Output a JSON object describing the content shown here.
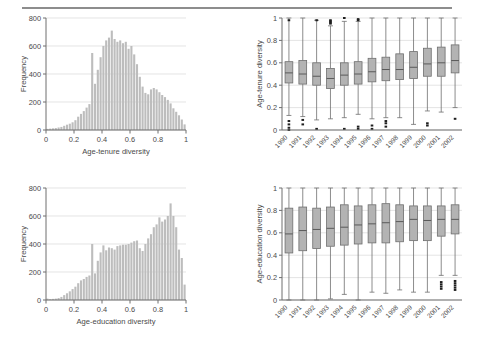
{
  "figure": {
    "caption_clipped": "",
    "panels": [
      "age-tenure-histogram",
      "age-tenure-boxplot",
      "age-education-histogram",
      "age-education-boxplot"
    ]
  },
  "colors": {
    "bar_fill": "#bdbdbd",
    "box_fill": "#b3b3b3",
    "line": "#6e6e6e",
    "grid": "#d8d8d8",
    "text": "#4a4a4a",
    "rule": "#8d8d8d"
  },
  "chart_data": [
    {
      "id": "age-tenure-histogram",
      "type": "bar",
      "title": "",
      "xlabel": "Age-tenure diversity",
      "ylabel": "Frequency",
      "xlim": [
        0,
        1
      ],
      "ylim": [
        0,
        800
      ],
      "xticks": [
        "0",
        "0.2",
        "0.4",
        "0.6",
        "0.8",
        "1"
      ],
      "xtick_values": [
        0,
        0.2,
        0.4,
        0.6,
        0.8,
        1
      ],
      "yticks": [
        "0",
        "200",
        "400",
        "600",
        "800"
      ],
      "ytick_values": [
        0,
        200,
        400,
        600,
        800
      ],
      "grid": "horizontal",
      "bin_width": 0.02,
      "categories": [
        0.01,
        0.03,
        0.05,
        0.07,
        0.09,
        0.11,
        0.13,
        0.15,
        0.17,
        0.19,
        0.21,
        0.23,
        0.25,
        0.27,
        0.29,
        0.31,
        0.33,
        0.35,
        0.37,
        0.39,
        0.41,
        0.43,
        0.45,
        0.47,
        0.49,
        0.51,
        0.53,
        0.55,
        0.57,
        0.59,
        0.61,
        0.63,
        0.65,
        0.67,
        0.69,
        0.71,
        0.73,
        0.75,
        0.77,
        0.79,
        0.81,
        0.83,
        0.85,
        0.87,
        0.89,
        0.91,
        0.93,
        0.95,
        0.97,
        0.99
      ],
      "values": [
        8,
        10,
        12,
        14,
        18,
        22,
        30,
        38,
        45,
        55,
        70,
        95,
        115,
        135,
        160,
        185,
        550,
        330,
        430,
        520,
        600,
        640,
        660,
        710,
        650,
        630,
        640,
        620,
        630,
        580,
        600,
        540,
        470,
        380,
        310,
        265,
        255,
        290,
        300,
        290,
        270,
        250,
        235,
        215,
        190,
        155,
        130,
        105,
        75,
        40
      ]
    },
    {
      "id": "age-tenure-boxplot",
      "type": "box",
      "title": "",
      "xlabel": "",
      "ylabel": "Age-tenure diversity",
      "ylim": [
        0,
        1
      ],
      "yticks": [
        "0",
        "0.2",
        "0.4",
        "0.6",
        "0.8",
        "1"
      ],
      "ytick_values": [
        0,
        0.2,
        0.4,
        0.6,
        0.8,
        1
      ],
      "grid": "horizontal",
      "categories": [
        "1990",
        "1991",
        "1992",
        "1993",
        "1994",
        "1995",
        "1996",
        "1997",
        "1998",
        "1999",
        "2000",
        "2001",
        "2002"
      ],
      "boxes": [
        {
          "label": "1990",
          "whisker_low": 0.13,
          "q1": 0.42,
          "median": 0.51,
          "q3": 0.61,
          "whisker_high": 1.0,
          "outliers_low": [
            0.0,
            0.02,
            0.05,
            0.08
          ],
          "outliers_high": [
            0.98
          ]
        },
        {
          "label": "1991",
          "whisker_low": 0.12,
          "q1": 0.41,
          "median": 0.5,
          "q3": 0.62,
          "whisker_high": 1.0,
          "outliers_low": [
            0.05,
            0.09
          ],
          "outliers_high": []
        },
        {
          "label": "1992",
          "whisker_low": 0.09,
          "q1": 0.4,
          "median": 0.48,
          "q3": 0.6,
          "whisker_high": 0.98,
          "outliers_low": [
            0.01
          ],
          "outliers_high": [
            0.98
          ]
        },
        {
          "label": "1993",
          "whisker_low": 0.1,
          "q1": 0.37,
          "median": 0.46,
          "q3": 0.55,
          "whisker_high": 0.93,
          "outliers_low": [],
          "outliers_high": [
            0.95,
            0.96,
            0.97,
            0.98
          ]
        },
        {
          "label": "1994",
          "whisker_low": 0.11,
          "q1": 0.4,
          "median": 0.49,
          "q3": 0.6,
          "whisker_high": 0.97,
          "outliers_low": [
            0.01
          ],
          "outliers_high": [
            1.0
          ]
        },
        {
          "label": "1995",
          "whisker_low": 0.14,
          "q1": 0.41,
          "median": 0.5,
          "q3": 0.61,
          "whisker_high": 0.97,
          "outliers_low": [
            0.01,
            0.03
          ],
          "outliers_high": [
            0.98,
            0.99
          ]
        },
        {
          "label": "1996",
          "whisker_low": 0.1,
          "q1": 0.43,
          "median": 0.52,
          "q3": 0.64,
          "whisker_high": 1.0,
          "outliers_low": [
            0.01,
            0.04
          ],
          "outliers_high": []
        },
        {
          "label": "1997",
          "whisker_low": 0.11,
          "q1": 0.44,
          "median": 0.54,
          "q3": 0.65,
          "whisker_high": 1.0,
          "outliers_low": [
            0.03,
            0.06,
            0.08
          ],
          "outliers_high": []
        },
        {
          "label": "1998",
          "whisker_low": 0.11,
          "q1": 0.45,
          "median": 0.54,
          "q3": 0.68,
          "whisker_high": 1.0,
          "outliers_low": [],
          "outliers_high": []
        },
        {
          "label": "1999",
          "whisker_low": 0.05,
          "q1": 0.46,
          "median": 0.56,
          "q3": 0.7,
          "whisker_high": 1.0,
          "outliers_low": [],
          "outliers_high": []
        },
        {
          "label": "2000",
          "whisker_low": 0.17,
          "q1": 0.48,
          "median": 0.59,
          "q3": 0.73,
          "whisker_high": 1.0,
          "outliers_low": [
            0.04,
            0.06
          ],
          "outliers_high": []
        },
        {
          "label": "2001",
          "whisker_low": 0.16,
          "q1": 0.48,
          "median": 0.6,
          "q3": 0.74,
          "whisker_high": 1.0,
          "outliers_low": [],
          "outliers_high": []
        },
        {
          "label": "2002",
          "whisker_low": 0.2,
          "q1": 0.51,
          "median": 0.62,
          "q3": 0.76,
          "whisker_high": 1.0,
          "outliers_low": [
            0.1
          ],
          "outliers_high": []
        }
      ]
    },
    {
      "id": "age-education-histogram",
      "type": "bar",
      "title": "",
      "xlabel": "Age-education diversity",
      "ylabel": "Frequency",
      "xlim": [
        0,
        1
      ],
      "ylim": [
        0,
        800
      ],
      "xticks": [
        "0",
        "0.2",
        "0.4",
        "0.6",
        "0.8",
        "1"
      ],
      "xtick_values": [
        0,
        0.2,
        0.4,
        0.6,
        0.8,
        1
      ],
      "yticks": [
        "0",
        "200",
        "400",
        "600",
        "800"
      ],
      "ytick_values": [
        0,
        200,
        400,
        600,
        800
      ],
      "grid": "horizontal",
      "bin_width": 0.02,
      "categories": [
        0.01,
        0.03,
        0.05,
        0.07,
        0.09,
        0.11,
        0.13,
        0.15,
        0.17,
        0.19,
        0.21,
        0.23,
        0.25,
        0.27,
        0.29,
        0.31,
        0.33,
        0.35,
        0.37,
        0.39,
        0.41,
        0.43,
        0.45,
        0.47,
        0.49,
        0.51,
        0.53,
        0.55,
        0.57,
        0.59,
        0.61,
        0.63,
        0.65,
        0.67,
        0.69,
        0.71,
        0.73,
        0.75,
        0.77,
        0.79,
        0.81,
        0.83,
        0.85,
        0.87,
        0.89,
        0.91,
        0.93,
        0.95,
        0.97,
        0.99
      ],
      "values": [
        10,
        6,
        8,
        10,
        14,
        22,
        35,
        48,
        62,
        78,
        95,
        120,
        140,
        150,
        165,
        175,
        400,
        190,
        280,
        340,
        390,
        355,
        375,
        370,
        360,
        385,
        390,
        395,
        395,
        400,
        410,
        420,
        425,
        370,
        350,
        400,
        440,
        470,
        520,
        540,
        590,
        560,
        575,
        600,
        690,
        600,
        520,
        360,
        300,
        110
      ]
    },
    {
      "id": "age-education-boxplot",
      "type": "box",
      "title": "",
      "xlabel": "",
      "ylabel": "Age-education diversity",
      "ylim": [
        0,
        1
      ],
      "yticks": [
        "0",
        "0.2",
        "0.4",
        "0.6",
        "0.8",
        "1"
      ],
      "ytick_values": [
        0,
        0.2,
        0.4,
        0.6,
        0.8,
        1
      ],
      "grid": "horizontal",
      "categories": [
        "1990",
        "1991",
        "1992",
        "1993",
        "1994",
        "1995",
        "1996",
        "1997",
        "1998",
        "1999",
        "2000",
        "2001",
        "2002"
      ],
      "boxes": [
        {
          "label": "1990",
          "whisker_low": 0.0,
          "q1": 0.42,
          "median": 0.59,
          "q3": 0.82,
          "whisker_high": 1.0,
          "outliers_low": [],
          "outliers_high": []
        },
        {
          "label": "1991",
          "whisker_low": 0.0,
          "q1": 0.44,
          "median": 0.62,
          "q3": 0.83,
          "whisker_high": 1.0,
          "outliers_low": [],
          "outliers_high": []
        },
        {
          "label": "1992",
          "whisker_low": 0.0,
          "q1": 0.46,
          "median": 0.63,
          "q3": 0.82,
          "whisker_high": 1.0,
          "outliers_low": [],
          "outliers_high": []
        },
        {
          "label": "1993",
          "whisker_low": 0.01,
          "q1": 0.48,
          "median": 0.64,
          "q3": 0.83,
          "whisker_high": 1.0,
          "outliers_low": [],
          "outliers_high": []
        },
        {
          "label": "1994",
          "whisker_low": 0.05,
          "q1": 0.49,
          "median": 0.65,
          "q3": 0.85,
          "whisker_high": 1.0,
          "outliers_low": [],
          "outliers_high": []
        },
        {
          "label": "1995",
          "whisker_low": 0.0,
          "q1": 0.5,
          "median": 0.67,
          "q3": 0.84,
          "whisker_high": 1.0,
          "outliers_low": [],
          "outliers_high": []
        },
        {
          "label": "1996",
          "whisker_low": 0.07,
          "q1": 0.51,
          "median": 0.68,
          "q3": 0.85,
          "whisker_high": 1.0,
          "outliers_low": [],
          "outliers_high": []
        },
        {
          "label": "1997",
          "whisker_low": 0.06,
          "q1": 0.51,
          "median": 0.69,
          "q3": 0.86,
          "whisker_high": 1.0,
          "outliers_low": [],
          "outliers_high": []
        },
        {
          "label": "1998",
          "whisker_low": 0.09,
          "q1": 0.52,
          "median": 0.7,
          "q3": 0.85,
          "whisker_high": 1.0,
          "outliers_low": [],
          "outliers_high": []
        },
        {
          "label": "1999",
          "whisker_low": 0.07,
          "q1": 0.53,
          "median": 0.72,
          "q3": 0.84,
          "whisker_high": 1.0,
          "outliers_low": [],
          "outliers_high": []
        },
        {
          "label": "2000",
          "whisker_low": 0.07,
          "q1": 0.53,
          "median": 0.71,
          "q3": 0.84,
          "whisker_high": 1.0,
          "outliers_low": [],
          "outliers_high": []
        },
        {
          "label": "2001",
          "whisker_low": 0.22,
          "q1": 0.57,
          "median": 0.72,
          "q3": 0.84,
          "whisker_high": 1.0,
          "outliers_low": [
            0.1,
            0.12,
            0.14,
            0.16
          ],
          "outliers_high": []
        },
        {
          "label": "2002",
          "whisker_low": 0.22,
          "q1": 0.59,
          "median": 0.72,
          "q3": 0.85,
          "whisker_high": 1.0,
          "outliers_low": [
            0.09,
            0.11,
            0.13,
            0.15,
            0.17
          ],
          "outliers_high": []
        }
      ]
    }
  ]
}
